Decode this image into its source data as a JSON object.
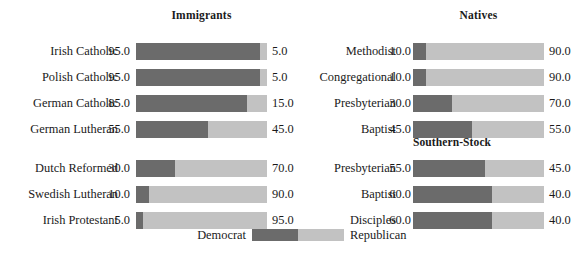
{
  "legend": {
    "democrat_label": "Democrat",
    "republican_label": "Republican",
    "democrat_color": "#6b6b6b",
    "republican_color": "#c2c2c2"
  },
  "panels": [
    {
      "id": "immigrants",
      "title": "Immigrants",
      "groups": [
        {
          "title": "",
          "rows": [
            {
              "label": "Irish Catholic",
              "democrat": "95.0",
              "republican": "5.0"
            },
            {
              "label": "Polish Catholic",
              "democrat": "95.0",
              "republican": "5.0"
            },
            {
              "label": "German Catholic",
              "democrat": "85.0",
              "republican": "15.0"
            },
            {
              "label": "German Lutheran",
              "democrat": "55.0",
              "republican": "45.0"
            }
          ]
        },
        {
          "title": "",
          "rows": [
            {
              "label": "Dutch Reformed",
              "democrat": "30.0",
              "republican": "70.0"
            },
            {
              "label": "Swedish Lutheran",
              "democrat": "10.0",
              "republican": "90.0"
            },
            {
              "label": "Irish Protestant",
              "democrat": "5.0",
              "republican": "95.0"
            }
          ]
        }
      ]
    },
    {
      "id": "natives",
      "title": "Natives",
      "groups": [
        {
          "title": "",
          "rows": [
            {
              "label": "Methodist",
              "democrat": "10.0",
              "republican": "90.0"
            },
            {
              "label": "Congregational",
              "democrat": "10.0",
              "republican": "90.0"
            },
            {
              "label": "Presbyterian",
              "democrat": "30.0",
              "republican": "70.0"
            },
            {
              "label": "Baptist",
              "democrat": "45.0",
              "republican": "55.0"
            }
          ]
        },
        {
          "title": "Southern-Stock",
          "rows": [
            {
              "label": "Presbyterian",
              "democrat": "55.0",
              "republican": "45.0"
            },
            {
              "label": "Baptist",
              "democrat": "60.0",
              "republican": "40.0"
            },
            {
              "label": "Disciples",
              "democrat": "60.0",
              "republican": "40.0"
            }
          ]
        }
      ]
    }
  ],
  "chart_data": {
    "type": "bar",
    "title": "",
    "subtype": "100% stacked horizontal bar",
    "xlabel": "",
    "ylabel": "",
    "xlim": [
      0,
      100
    ],
    "grid": false,
    "legend_position": "bottom-center",
    "series": [
      {
        "name": "Democrat",
        "color": "#6b6b6b"
      },
      {
        "name": "Republican",
        "color": "#c2c2c2"
      }
    ],
    "panels": [
      {
        "name": "Immigrants",
        "categories": [
          "Irish Catholic",
          "Polish Catholic",
          "German Catholic",
          "German Lutheran",
          "Dutch Reformed",
          "Swedish Lutheran",
          "Irish Protestant"
        ],
        "values": {
          "Democrat": [
            95.0,
            95.0,
            85.0,
            55.0,
            30.0,
            10.0,
            5.0
          ],
          "Republican": [
            5.0,
            5.0,
            15.0,
            45.0,
            70.0,
            90.0,
            95.0
          ]
        }
      },
      {
        "name": "Natives",
        "categories": [
          "Methodist",
          "Congregational",
          "Presbyterian",
          "Baptist",
          "Presbyterian (Southern-Stock)",
          "Baptist (Southern-Stock)",
          "Disciples (Southern-Stock)"
        ],
        "values": {
          "Democrat": [
            10.0,
            10.0,
            30.0,
            45.0,
            55.0,
            60.0,
            60.0
          ],
          "Republican": [
            90.0,
            90.0,
            70.0,
            55.0,
            45.0,
            40.0,
            40.0
          ]
        }
      }
    ]
  }
}
